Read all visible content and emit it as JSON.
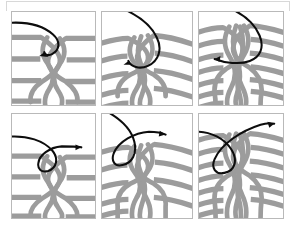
{
  "figure": {
    "kind": "braid-sequence-diagram",
    "panel_count": 6,
    "rows": 2,
    "columns": 3,
    "background_color": "#ffffff",
    "strand_color": "#9c9c9c",
    "arrow_color": "#0d0d0d",
    "border_color": "#b9b9b9",
    "outer_frame_color": "#d8d8d8"
  },
  "panels": [
    {
      "id": "panel-1",
      "position": "row-1-col-1",
      "horizontal_strands": 4,
      "braid_strands": 4,
      "strand_shape": "straight",
      "arrow": {
        "name": "curl-over-arrow",
        "direction": "down-left",
        "shape": "hook-over-from-left",
        "head_x": 37,
        "head_y": 45
      }
    },
    {
      "id": "panel-2",
      "position": "row-1-col-2",
      "horizontal_strands": 5,
      "braid_strands": 5,
      "strand_shape": "arced",
      "arrow": {
        "name": "curl-over-arrow",
        "direction": "down-left",
        "shape": "long-loop-from-top",
        "head_x": 30,
        "head_y": 52
      }
    },
    {
      "id": "panel-3",
      "position": "row-1-col-3",
      "horizontal_strands": 7,
      "braid_strands": 6,
      "strand_shape": "arced-dense",
      "arrow": {
        "name": "curl-over-arrow",
        "direction": "down-left",
        "shape": "hook-over-from-top",
        "head_x": 18,
        "head_y": 47
      }
    },
    {
      "id": "panel-4",
      "position": "row-2-col-1",
      "horizontal_strands": 4,
      "braid_strands": 4,
      "strand_shape": "straight",
      "arrow": {
        "name": "sweep-right-arrow",
        "direction": "right",
        "shape": "loop-through-to-right",
        "head_x": 72,
        "head_y": 34
      }
    },
    {
      "id": "panel-5",
      "position": "row-2-col-2",
      "horizontal_strands": 5,
      "braid_strands": 5,
      "strand_shape": "arced",
      "arrow": {
        "name": "sweep-right-arrow",
        "direction": "up-right",
        "shape": "loop-through-to-upper-right",
        "head_x": 66,
        "head_y": 20
      }
    },
    {
      "id": "panel-6",
      "position": "row-2-col-3",
      "horizontal_strands": 7,
      "braid_strands": 6,
      "strand_shape": "arced-dense",
      "arrow": {
        "name": "sweep-right-arrow",
        "direction": "up-right",
        "shape": "loop-through-to-upper-right",
        "head_x": 74,
        "head_y": 12
      }
    }
  ]
}
